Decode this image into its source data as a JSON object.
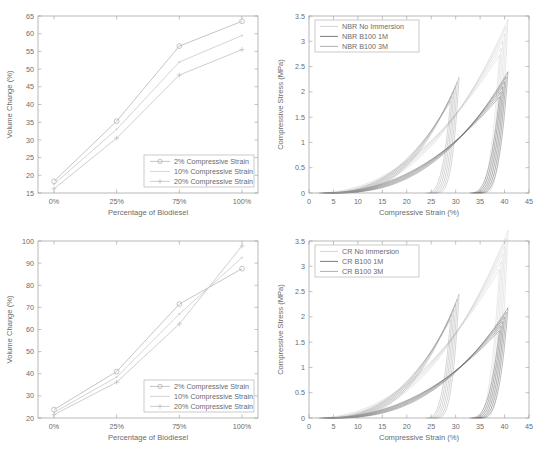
{
  "figure": {
    "background": "#ffffff",
    "panel_count": 4
  },
  "common": {
    "volume_xlabel": "Percentage of Biodiesel",
    "volume_ylabel": "Volume Change (%)",
    "stress_xlabel": "Compressive Strain (%)",
    "stress_ylabel": "Compressive Stress (MPa)",
    "volume_categories": [
      "0%",
      "25%",
      "75%",
      "100%"
    ],
    "volume_legend": [
      "2% Compressive Strain",
      "10% Compressive Strain",
      "20% Compressive Strain"
    ],
    "stress_xticks": [
      "0",
      "5",
      "10",
      "15",
      "20",
      "25",
      "30",
      "35",
      "40",
      "45"
    ],
    "stress_yticks": [
      "0",
      "0.5",
      "1",
      "1.5",
      "2",
      "2.5",
      "3",
      "3.5"
    ],
    "marker_2pct": "circle",
    "marker_10pct": "dot",
    "marker_20pct": "plus"
  },
  "colors": {
    "axis": "#9a9a9a",
    "text": "#6b6b6b",
    "series_2pct": "#b6b6b6",
    "series_10pct": "#c9c9c9",
    "series_20pct": "#c2c2c2",
    "curve_dark": "#5a5a5a",
    "curve_mid": "#9b9b9b",
    "curve_light": "#c8c8c8"
  },
  "chart_data": [
    {
      "id": "nbr-volume-change",
      "position": "top-left",
      "type": "line",
      "title": "",
      "xlabel": "Percentage of Biodiesel",
      "ylabel": "Volume Change (%)",
      "categories": [
        "0%",
        "25%",
        "75%",
        "100%"
      ],
      "yticks": [
        15,
        20,
        25,
        30,
        35,
        40,
        45,
        50,
        55,
        60,
        65
      ],
      "ylim": [
        15,
        65
      ],
      "grid": false,
      "legend_position": "lower-right",
      "series": [
        {
          "name": "2% Compressive Strain",
          "marker": "circle",
          "values": [
            18.3,
            35.3,
            56.5,
            63.5
          ]
        },
        {
          "name": "10% Compressive Strain",
          "marker": "dot",
          "values": [
            17.5,
            33.0,
            52.0,
            59.5
          ]
        },
        {
          "name": "20% Compressive Strain",
          "marker": "plus",
          "values": [
            16.2,
            30.5,
            48.3,
            55.5
          ]
        }
      ]
    },
    {
      "id": "nbr-stress-strain",
      "position": "top-right",
      "type": "line",
      "title": "",
      "xlabel": "Compressive Strain (%)",
      "ylabel": "Compressive Stress (MPa)",
      "xticks": [
        0,
        5,
        10,
        15,
        20,
        25,
        30,
        35,
        40,
        45
      ],
      "yticks": [
        0,
        0.5,
        1,
        1.5,
        2,
        2.5,
        3,
        3.5
      ],
      "xlim": [
        0,
        45
      ],
      "ylim": [
        0,
        3.5
      ],
      "grid": false,
      "legend_position": "upper-left",
      "series": [
        {
          "name": "NBR No Immersion",
          "shade": "#c8c8c8",
          "peak_strain": 40,
          "peak_stress": 3.15,
          "unload_to_strain": 35
        },
        {
          "name": "NBR B100 1M",
          "shade": "#5a5a5a",
          "peak_strain": 40,
          "peak_stress": 2.2,
          "unload_to_strain": 34
        },
        {
          "name": "NBR B100 3M",
          "shade": "#9b9b9b",
          "peak_strain": 30,
          "peak_stress": 2.1,
          "unload_to_strain": 25
        }
      ]
    },
    {
      "id": "cr-volume-change",
      "position": "bottom-left",
      "type": "line",
      "title": "",
      "xlabel": "Percentage of Biodiesel",
      "ylabel": "Volume Change (%)",
      "categories": [
        "0%",
        "25%",
        "75%",
        "100%"
      ],
      "yticks": [
        20,
        30,
        40,
        50,
        60,
        70,
        80,
        90,
        100
      ],
      "ylim": [
        20,
        100
      ],
      "grid": false,
      "legend_position": "lower-right",
      "series": [
        {
          "name": "2% Compressive Strain",
          "marker": "circle",
          "values": [
            23.8,
            41.0,
            71.5,
            87.5
          ]
        },
        {
          "name": "10% Compressive Strain",
          "marker": "dot",
          "values": [
            22.5,
            38.5,
            67.0,
            92.5
          ]
        },
        {
          "name": "20% Compressive Strain",
          "marker": "plus",
          "values": [
            21.5,
            36.2,
            62.5,
            97.8
          ]
        }
      ]
    },
    {
      "id": "cr-stress-strain",
      "position": "bottom-right",
      "type": "line",
      "title": "",
      "xlabel": "Compressive Strain (%)",
      "ylabel": "Compressive Stress (MPa)",
      "xticks": [
        0,
        5,
        10,
        15,
        20,
        25,
        30,
        35,
        40,
        45
      ],
      "yticks": [
        0,
        0.5,
        1,
        1.5,
        2,
        2.5,
        3,
        3.5
      ],
      "xlim": [
        0,
        45
      ],
      "ylim": [
        0,
        3.5
      ],
      "grid": false,
      "legend_position": "upper-left",
      "series": [
        {
          "name": "CR No Immersion",
          "shade": "#c8c8c8",
          "peak_strain": 40,
          "peak_stress": 3.4,
          "unload_to_strain": 35
        },
        {
          "name": "CR B100 1M",
          "shade": "#5a5a5a",
          "peak_strain": 40,
          "peak_stress": 2.0,
          "unload_to_strain": 34
        },
        {
          "name": "CR B100 3M",
          "shade": "#9b9b9b",
          "peak_strain": 30,
          "peak_stress": 2.25,
          "unload_to_strain": 25
        }
      ]
    }
  ],
  "panels": {
    "top_left": {
      "legend": [
        "2% Compressive Strain",
        "10% Compressive Strain",
        "20% Compressive Strain"
      ],
      "xlabel": "Percentage of Biodiesel",
      "ylabel": "Volume Change (%)",
      "xticks": [
        "0%",
        "25%",
        "75%",
        "100%"
      ],
      "yticks": [
        "15",
        "20",
        "25",
        "30",
        "35",
        "40",
        "45",
        "50",
        "55",
        "60",
        "65"
      ]
    },
    "top_right": {
      "legend": [
        "NBR No Immersion",
        "NBR B100 1M",
        "NBR B100 3M"
      ],
      "xlabel": "Compressive Strain (%)",
      "ylabel": "Compressive Stress (MPa)",
      "xticks": [
        "0",
        "5",
        "10",
        "15",
        "20",
        "25",
        "30",
        "35",
        "40",
        "45"
      ],
      "yticks": [
        "0",
        "0.5",
        "1",
        "1.5",
        "2",
        "2.5",
        "3",
        "3.5"
      ]
    },
    "bottom_left": {
      "legend": [
        "2% Compressive Strain",
        "10% Compressive Strain",
        "20% Compressive Strain"
      ],
      "xlabel": "Percentage of Biodiesel",
      "ylabel": "Volume Change (%)",
      "xticks": [
        "0%",
        "25%",
        "75%",
        "100%"
      ],
      "yticks": [
        "20",
        "30",
        "40",
        "50",
        "60",
        "70",
        "80",
        "90",
        "100"
      ]
    },
    "bottom_right": {
      "legend": [
        "CR No Immersion",
        "CR B100 1M",
        "CR B100 3M"
      ],
      "xlabel": "Compressive Strain (%)",
      "ylabel": "Compressive Stress (MPa)",
      "xticks": [
        "0",
        "5",
        "10",
        "15",
        "20",
        "25",
        "30",
        "35",
        "40",
        "45"
      ],
      "yticks": [
        "0",
        "0.5",
        "1",
        "1.5",
        "2",
        "2.5",
        "3",
        "3.5"
      ]
    }
  }
}
